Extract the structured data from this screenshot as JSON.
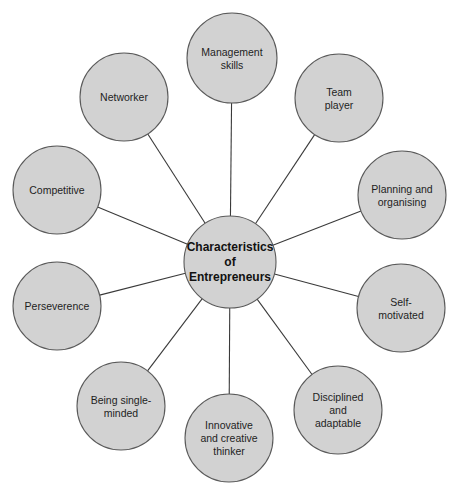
{
  "diagram": {
    "type": "hub-and-spoke mind map",
    "center": {
      "label_lines": [
        "Characteristics",
        "of",
        "Entrepreneurs"
      ]
    },
    "nodes": [
      {
        "id": "management-skills",
        "label_lines": [
          "Management",
          "skills"
        ]
      },
      {
        "id": "team-player",
        "label_lines": [
          "Team",
          "player"
        ]
      },
      {
        "id": "planning-and-organising",
        "label_lines": [
          "Planning and",
          "organising"
        ]
      },
      {
        "id": "self-motivated",
        "label_lines": [
          "Self-",
          "motivated"
        ]
      },
      {
        "id": "disciplined-and-adaptable",
        "label_lines": [
          "Disciplined",
          "and",
          "adaptable"
        ]
      },
      {
        "id": "innovative-and-creative-thinker",
        "label_lines": [
          "Innovative",
          "and creative",
          "thinker"
        ]
      },
      {
        "id": "being-single-minded",
        "label_lines": [
          "Being single-",
          "minded"
        ]
      },
      {
        "id": "perseverence",
        "label_lines": [
          "Perseverence"
        ]
      },
      {
        "id": "competitive",
        "label_lines": [
          "Competitive"
        ]
      },
      {
        "id": "networker",
        "label_lines": [
          "Networker"
        ]
      }
    ],
    "colors": {
      "node_fill": "#d2d2d2",
      "node_stroke": "#5a5a5a",
      "connector": "#3a3a3a",
      "text": "#1e1e1e"
    }
  }
}
